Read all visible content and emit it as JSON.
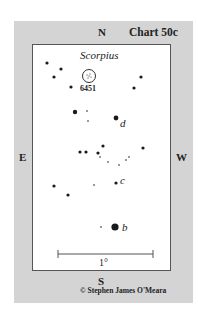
{
  "chart": {
    "title": "Chart 50c",
    "constellation": "Scorpius",
    "directions": {
      "north": "N",
      "south": "S",
      "east": "E",
      "west": "W"
    },
    "scale_label": "1°",
    "credit": "© Stephen James O'Meara",
    "object": {
      "label": "6451",
      "cx": 89,
      "cy": 76,
      "r": 6.5
    },
    "star_labels": [
      {
        "text": "d",
        "x": 120,
        "y": 127
      },
      {
        "text": "c",
        "x": 120,
        "y": 184
      },
      {
        "text": "b",
        "x": 122,
        "y": 231
      }
    ],
    "stars": [
      {
        "x": 47,
        "y": 63,
        "r": 1.6
      },
      {
        "x": 61,
        "y": 69,
        "r": 1.6
      },
      {
        "x": 54,
        "y": 77,
        "r": 1.6
      },
      {
        "x": 71,
        "y": 87,
        "r": 1.6
      },
      {
        "x": 141,
        "y": 77,
        "r": 1.6
      },
      {
        "x": 134,
        "y": 88,
        "r": 1.6
      },
      {
        "x": 75,
        "y": 112,
        "r": 2.2
      },
      {
        "x": 87,
        "y": 111,
        "r": 0.8
      },
      {
        "x": 88,
        "y": 121,
        "r": 0.8
      },
      {
        "x": 116,
        "y": 118,
        "r": 2.4
      },
      {
        "x": 103,
        "y": 146,
        "r": 1.6
      },
      {
        "x": 80,
        "y": 152,
        "r": 1.6
      },
      {
        "x": 86,
        "y": 152,
        "r": 1.6
      },
      {
        "x": 98,
        "y": 153,
        "r": 1.6
      },
      {
        "x": 100,
        "y": 157,
        "r": 0.8
      },
      {
        "x": 108,
        "y": 162,
        "r": 0.8
      },
      {
        "x": 119,
        "y": 165,
        "r": 0.8
      },
      {
        "x": 126,
        "y": 160,
        "r": 0.8
      },
      {
        "x": 129,
        "y": 157,
        "r": 0.8
      },
      {
        "x": 143,
        "y": 148,
        "r": 1.6
      },
      {
        "x": 54,
        "y": 186,
        "r": 1.6
      },
      {
        "x": 68,
        "y": 195,
        "r": 1.6
      },
      {
        "x": 94,
        "y": 185,
        "r": 0.8
      },
      {
        "x": 116,
        "y": 183,
        "r": 1.6
      },
      {
        "x": 101,
        "y": 227,
        "r": 0.8
      },
      {
        "x": 115,
        "y": 227,
        "r": 3.6
      }
    ],
    "scale_bar": {
      "x1": 58,
      "x2": 153,
      "y": 254
    },
    "colors": {
      "panel": "#d4d4d4",
      "frame": "#ffffff",
      "ink": "#1a1a1a"
    }
  }
}
